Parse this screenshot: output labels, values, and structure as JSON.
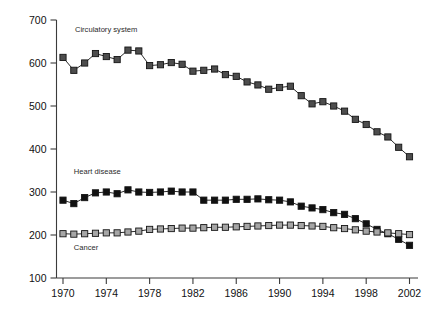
{
  "chart_data": {
    "type": "line",
    "title": "",
    "subtitle": "",
    "xlabel": "",
    "ylabel": "",
    "xlim": [
      1969.4,
      2002.6
    ],
    "ylim": [
      100,
      700
    ],
    "x_ticks": [
      1970,
      1974,
      1978,
      1982,
      1986,
      1990,
      1994,
      1998,
      2002
    ],
    "y_ticks": [
      100,
      200,
      300,
      400,
      500,
      600,
      700
    ],
    "grid": false,
    "legend_position": "inline-annotations",
    "x": [
      1970,
      1971,
      1972,
      1973,
      1974,
      1975,
      1976,
      1977,
      1978,
      1979,
      1980,
      1981,
      1982,
      1983,
      1984,
      1985,
      1986,
      1987,
      1988,
      1989,
      1990,
      1991,
      1992,
      1993,
      1994,
      1995,
      1996,
      1997,
      1998,
      1999,
      2000,
      2001,
      2002
    ],
    "series": [
      {
        "name": "Circulatory system",
        "marker": "square",
        "color": "#4d4d4d",
        "label_x": 1971.1,
        "label_y": 672,
        "values": [
          613,
          583,
          600,
          622,
          615,
          608,
          630,
          628,
          594,
          596,
          601,
          597,
          581,
          583,
          586,
          573,
          569,
          556,
          549,
          539,
          543,
          546,
          524,
          505,
          510,
          500,
          488,
          469,
          457,
          440,
          428,
          404,
          382
        ]
      },
      {
        "name": "Heart disease",
        "marker": "square",
        "color": "#111111",
        "label_x": 1971.0,
        "label_y": 343,
        "values": [
          281,
          273,
          287,
          298,
          300,
          296,
          305,
          300,
          299,
          300,
          302,
          300,
          300,
          281,
          281,
          281,
          283,
          283,
          284,
          282,
          281,
          277,
          267,
          263,
          259,
          252,
          248,
          238,
          226,
          213,
          203,
          190,
          176
        ]
      },
      {
        "name": "Cancer",
        "marker": "square",
        "color": "#a6a6a6",
        "label_x": 1971.0,
        "label_y": 166,
        "values": [
          203,
          202,
          203,
          204,
          205,
          205,
          207,
          209,
          213,
          214,
          215,
          216,
          216,
          217,
          218,
          218,
          219,
          220,
          221,
          222,
          223,
          223,
          222,
          221,
          220,
          217,
          215,
          212,
          209,
          207,
          205,
          203,
          201
        ]
      }
    ]
  }
}
